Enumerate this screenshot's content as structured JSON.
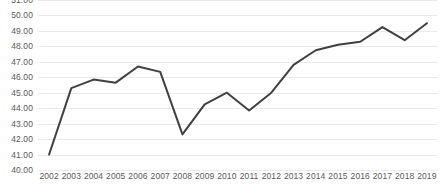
{
  "chart_data": {
    "type": "line",
    "title": "",
    "xlabel": "",
    "ylabel": "",
    "categories": [
      "2002",
      "2003",
      "2004",
      "2005",
      "2006",
      "2007",
      "2008",
      "2009",
      "2010",
      "2011",
      "2012",
      "2013",
      "2014",
      "2015",
      "2016",
      "2017",
      "2018",
      "2019"
    ],
    "values": [
      41.0,
      45.3,
      45.85,
      45.65,
      46.7,
      46.35,
      42.3,
      44.25,
      45.0,
      43.85,
      45.0,
      46.8,
      47.75,
      48.1,
      48.3,
      49.25,
      48.4,
      49.5
    ],
    "series": [
      {
        "name": "value",
        "values": [
          41.0,
          45.3,
          45.85,
          45.65,
          46.7,
          46.35,
          42.3,
          44.25,
          45.0,
          43.85,
          45.0,
          46.8,
          47.75,
          48.1,
          48.3,
          49.25,
          48.4,
          49.5
        ]
      }
    ],
    "ylim": [
      40.0,
      51.0
    ],
    "ytick_step": 1.0,
    "ytick_labels": [
      "51.00",
      "50.00",
      "49.00",
      "48.00",
      "47.00",
      "46.00",
      "45.00",
      "44.00",
      "43.00",
      "42.00",
      "41.00",
      "40.00"
    ],
    "ytick_values": [
      51.0,
      50.0,
      49.0,
      48.0,
      47.0,
      46.0,
      45.0,
      44.0,
      43.0,
      42.0,
      41.0,
      40.0
    ],
    "grid": true,
    "grid_axis": "y",
    "legend": false,
    "legend_position": "none",
    "line_color": "#404040",
    "line_width": 2,
    "markers": false,
    "background_color": "#ffffff",
    "gridline_color": "#eceaea",
    "tick_label_color": "#595959"
  }
}
